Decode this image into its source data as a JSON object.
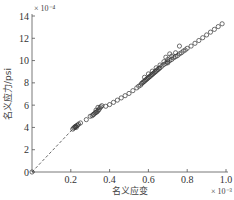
{
  "chart_data": {
    "type": "scatter",
    "title": "",
    "xlabel": "名义应变",
    "ylabel": "名义应力/psi",
    "x_multiplier": "× 10⁻³",
    "y_multiplier": "× 10⁻⁴",
    "xlim": [
      0,
      1.0
    ],
    "ylim": [
      0,
      14
    ],
    "x_ticks": [
      "0.2",
      "0.4",
      "0.6",
      "0.8",
      "1.0"
    ],
    "x_tick_values": [
      0.2,
      0.4,
      0.6,
      0.8,
      1.0
    ],
    "y_ticks": [
      "0",
      "2",
      "4",
      "6",
      "8",
      "10",
      "12",
      "14"
    ],
    "y_tick_values": [
      0,
      2,
      4,
      6,
      8,
      10,
      12,
      14
    ],
    "grid": false,
    "legend": "none",
    "series": [
      {
        "name": "measured",
        "marker": "open-circle",
        "color": "#333333",
        "points": [
          [
            0.0,
            0.0
          ],
          [
            0.21,
            3.85
          ],
          [
            0.215,
            3.95
          ],
          [
            0.22,
            4.0
          ],
          [
            0.222,
            4.05
          ],
          [
            0.225,
            4.1
          ],
          [
            0.228,
            4.0
          ],
          [
            0.23,
            4.15
          ],
          [
            0.235,
            4.2
          ],
          [
            0.24,
            4.3
          ],
          [
            0.25,
            4.4
          ],
          [
            0.28,
            4.7
          ],
          [
            0.3,
            5.0
          ],
          [
            0.31,
            5.05
          ],
          [
            0.315,
            5.15
          ],
          [
            0.32,
            5.2
          ],
          [
            0.325,
            5.3
          ],
          [
            0.33,
            5.35
          ],
          [
            0.335,
            5.4
          ],
          [
            0.34,
            5.5
          ],
          [
            0.345,
            5.6
          ],
          [
            0.35,
            5.75
          ],
          [
            0.355,
            5.85
          ],
          [
            0.36,
            5.95
          ],
          [
            0.34,
            5.8
          ],
          [
            0.33,
            5.55
          ],
          [
            0.38,
            5.9
          ],
          [
            0.4,
            6.05
          ],
          [
            0.42,
            6.25
          ],
          [
            0.44,
            6.45
          ],
          [
            0.46,
            6.65
          ],
          [
            0.48,
            6.85
          ],
          [
            0.5,
            7.05
          ],
          [
            0.52,
            7.3
          ],
          [
            0.54,
            7.55
          ],
          [
            0.55,
            7.7
          ],
          [
            0.56,
            7.8
          ],
          [
            0.565,
            7.95
          ],
          [
            0.57,
            8.0
          ],
          [
            0.575,
            8.1
          ],
          [
            0.58,
            8.15
          ],
          [
            0.585,
            8.25
          ],
          [
            0.59,
            8.3
          ],
          [
            0.595,
            8.4
          ],
          [
            0.6,
            8.45
          ],
          [
            0.605,
            8.55
          ],
          [
            0.61,
            8.6
          ],
          [
            0.615,
            8.7
          ],
          [
            0.62,
            8.75
          ],
          [
            0.625,
            8.85
          ],
          [
            0.63,
            8.9
          ],
          [
            0.635,
            9.0
          ],
          [
            0.64,
            9.05
          ],
          [
            0.645,
            9.15
          ],
          [
            0.65,
            9.2
          ],
          [
            0.655,
            9.3
          ],
          [
            0.66,
            9.35
          ],
          [
            0.58,
            8.5
          ],
          [
            0.6,
            8.8
          ],
          [
            0.62,
            9.05
          ],
          [
            0.64,
            9.35
          ],
          [
            0.66,
            9.6
          ],
          [
            0.68,
            9.9
          ],
          [
            0.7,
            10.1
          ],
          [
            0.72,
            10.4
          ],
          [
            0.7,
            9.8
          ],
          [
            0.69,
            10.3
          ],
          [
            0.71,
            10.6
          ],
          [
            0.74,
            10.7
          ],
          [
            0.67,
            9.5
          ],
          [
            0.68,
            9.65
          ],
          [
            0.69,
            9.75
          ],
          [
            0.7,
            9.9
          ],
          [
            0.71,
            10.0
          ],
          [
            0.72,
            10.1
          ],
          [
            0.73,
            10.25
          ],
          [
            0.74,
            10.35
          ],
          [
            0.75,
            10.45
          ],
          [
            0.76,
            10.6
          ],
          [
            0.77,
            10.7
          ],
          [
            0.78,
            10.85
          ],
          [
            0.79,
            10.95
          ],
          [
            0.8,
            11.1
          ],
          [
            0.76,
            11.3
          ],
          [
            0.82,
            11.3
          ],
          [
            0.84,
            11.55
          ],
          [
            0.86,
            11.8
          ],
          [
            0.88,
            12.05
          ],
          [
            0.9,
            12.3
          ],
          [
            0.92,
            12.55
          ],
          [
            0.94,
            12.8
          ],
          [
            0.96,
            13.05
          ],
          [
            0.98,
            13.3
          ]
        ]
      }
    ],
    "reference_line": {
      "style": "dashed",
      "from": [
        0.0,
        0.0
      ],
      "to": [
        0.21,
        3.85
      ]
    }
  }
}
